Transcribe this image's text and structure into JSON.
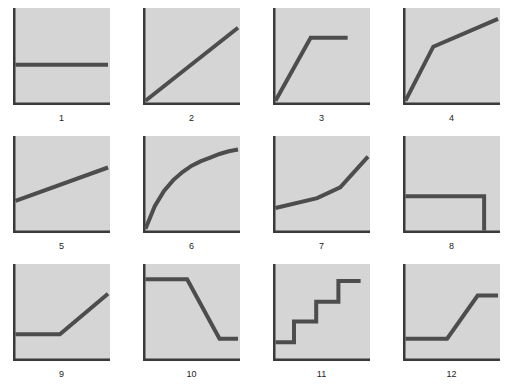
{
  "figure": {
    "background_color": "#ffffff",
    "panel_fill_color": "#d5d5d5",
    "axis_color": "#3a3a3a",
    "curve_color": "#4d4d4d",
    "label_color": "#1c1c1c",
    "rows": 3,
    "columns": 4,
    "panel_count": 12
  },
  "chart_data": {
    "type": "line",
    "title": "",
    "subtitle": "",
    "xlabel": "",
    "ylabel": "",
    "grid": false,
    "legend": "none",
    "xlim": [
      0,
      1
    ],
    "ylim": [
      0,
      1
    ],
    "axis_ticks": {
      "x": [],
      "y": []
    },
    "note": "Twelve small multiples of schematic response shapes; axes unlabeled, values normalized 0-1 within each panel frame.",
    "panels": [
      {
        "label": "1",
        "shape": "flat constant",
        "x": [
          0.0,
          1.0
        ],
        "y": [
          0.42,
          0.42
        ]
      },
      {
        "label": "2",
        "shape": "linear increase from origin",
        "x": [
          0.0,
          1.0
        ],
        "y": [
          0.02,
          0.83
        ]
      },
      {
        "label": "3",
        "shape": "steep rise then plateau",
        "x": [
          0.0,
          0.38,
          0.78
        ],
        "y": [
          0.02,
          0.72,
          0.72
        ]
      },
      {
        "label": "4",
        "shape": "steep rise then shallower rise",
        "x": [
          0.0,
          0.3,
          1.0
        ],
        "y": [
          0.02,
          0.62,
          0.93
        ]
      },
      {
        "label": "5",
        "shape": "gentle linear increase from positive intercept",
        "x": [
          0.0,
          1.0
        ],
        "y": [
          0.33,
          0.7
        ]
      },
      {
        "label": "6",
        "shape": "concave increasing curve (logarithmic)",
        "x": [
          0.0,
          0.1,
          0.2,
          0.3,
          0.4,
          0.5,
          0.6,
          0.7,
          0.8,
          0.9,
          1.0
        ],
        "y": [
          0.02,
          0.27,
          0.44,
          0.56,
          0.65,
          0.72,
          0.77,
          0.81,
          0.85,
          0.88,
          0.9
        ]
      },
      {
        "label": "7",
        "shape": "slow rise then accelerating increase (convex)",
        "x": [
          0.0,
          0.45,
          0.7,
          1.0
        ],
        "y": [
          0.25,
          0.36,
          0.48,
          0.82
        ]
      },
      {
        "label": "8",
        "shape": "constant then abrupt drop to zero",
        "x": [
          0.0,
          0.85,
          0.85
        ],
        "y": [
          0.38,
          0.38,
          0.0
        ]
      },
      {
        "label": "9",
        "shape": "flat then linear increase",
        "x": [
          0.0,
          0.48,
          1.0
        ],
        "y": [
          0.27,
          0.27,
          0.72
        ]
      },
      {
        "label": "10",
        "shape": "flat high then decrease to flat low",
        "x": [
          0.0,
          0.45,
          0.8,
          1.0
        ],
        "y": [
          0.88,
          0.88,
          0.22,
          0.22
        ]
      },
      {
        "label": "11",
        "shape": "ascending step function",
        "x": [
          0.0,
          0.2,
          0.2,
          0.44,
          0.44,
          0.68,
          0.68,
          0.92
        ],
        "y": [
          0.18,
          0.18,
          0.41,
          0.41,
          0.63,
          0.63,
          0.86,
          0.86
        ]
      },
      {
        "label": "12",
        "shape": "flat low, ramp up, flat high",
        "x": [
          0.0,
          0.45,
          0.78,
          1.0
        ],
        "y": [
          0.22,
          0.22,
          0.7,
          0.7
        ]
      }
    ]
  }
}
